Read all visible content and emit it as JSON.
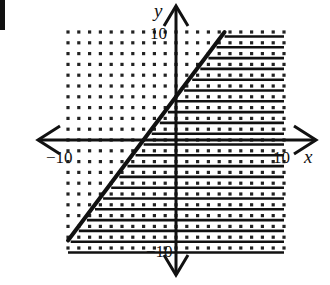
{
  "chart_data": {
    "type": "inequality-graph",
    "title": "",
    "xlabel": "x",
    "ylabel": "y",
    "xlim": [
      -10,
      10
    ],
    "ylim": [
      -10,
      10
    ],
    "grid": "dotted",
    "tick_labels": {
      "x_min": "−10",
      "x_max": "10",
      "y_max": "10",
      "y_min": "−10"
    },
    "boundary_line": {
      "style": "solid",
      "slope": 1.3333,
      "intercept": 4,
      "points": [
        [
          -10,
          -9.3
        ],
        [
          4.5,
          10
        ]
      ]
    },
    "shaded_region": "below-right of line (y ≤ (4/3)x + 4)",
    "shading_style": "horizontal lines"
  },
  "colors": {
    "ink": "#111111",
    "background": "#ffffff"
  },
  "labels": {
    "x_axis": "x",
    "y_axis": "y",
    "x_min": "−10",
    "x_max": "10",
    "y_max": "10",
    "y_min": "−10"
  }
}
